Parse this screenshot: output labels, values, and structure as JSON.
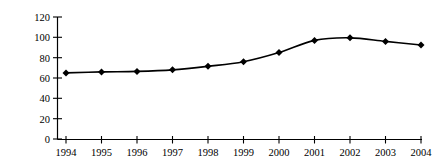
{
  "chart_data": {
    "type": "line",
    "title": "",
    "subtitle": "",
    "xlabel": "",
    "ylabel": "%",
    "categories": [
      "1994",
      "1995",
      "1996",
      "1997",
      "1998",
      "1999",
      "2000",
      "2001",
      "2002",
      "2003",
      "2004"
    ],
    "values": [
      65,
      66,
      66.5,
      68,
      71.5,
      76,
      85,
      97,
      99.5,
      96,
      92.5
    ],
    "series": [
      {
        "name": "",
        "values": [
          65,
          66,
          66.5,
          68,
          71.5,
          76,
          85,
          97,
          99.5,
          96,
          92.5
        ]
      }
    ],
    "ylim": [
      0,
      120
    ],
    "yticks": [
      0,
      20,
      40,
      60,
      80,
      100,
      120
    ],
    "ytick_labels": [
      "0",
      "20",
      "40",
      "60",
      "80",
      "100",
      "120"
    ],
    "xtick_labels": [
      "1994",
      "1995",
      "1996",
      "1997",
      "1998",
      "1999",
      "2000",
      "2001",
      "2002",
      "2003",
      "2004"
    ],
    "grid": false,
    "legend": false,
    "legend_position": "none",
    "marker": "diamond",
    "line_color": "#000000",
    "marker_color": "#000000",
    "axis_color": "#000000",
    "background_color": "#ffffff"
  },
  "axes": {
    "y_label_text": "%",
    "y_tick_0": "0",
    "y_tick_20": "20",
    "y_tick_40": "40",
    "y_tick_60": "60",
    "y_tick_80": "80",
    "y_tick_100": "100",
    "y_tick_120": "120",
    "x_tick_1994": "1994",
    "x_tick_1995": "1995",
    "x_tick_1996": "1996",
    "x_tick_1997": "1997",
    "x_tick_1998": "1998",
    "x_tick_1999": "1999",
    "x_tick_2000": "2000",
    "x_tick_2001": "2001",
    "x_tick_2002": "2002",
    "x_tick_2003": "2003",
    "x_tick_2004": "2004"
  }
}
